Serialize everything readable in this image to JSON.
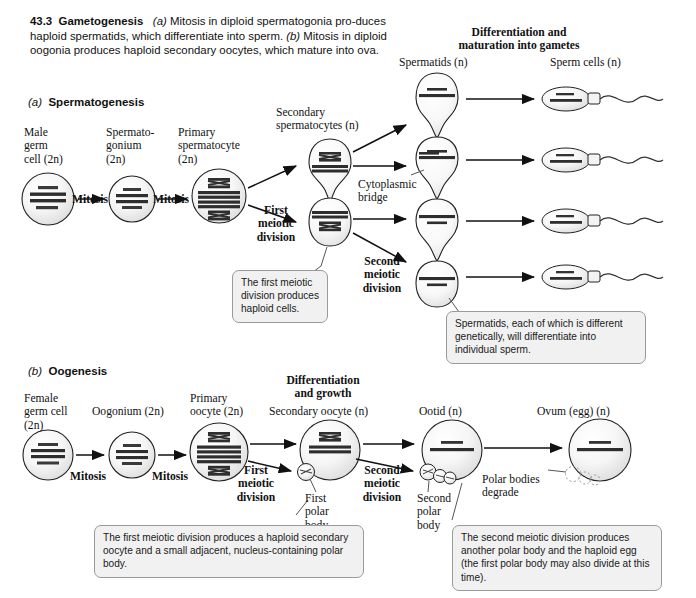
{
  "figure": {
    "number": "43.3",
    "title": "Gametogenesis",
    "caption_a_marker": "(a)",
    "caption_a": " Mitosis in diploid spermatogonia pro-duces haploid spermatids, which differentiate into sperm. ",
    "caption_b_marker": "(b)",
    "caption_b": " Mitosis in diploid oogonia produces haploid secondary oocytes, which mature into ova."
  },
  "section_a": {
    "marker": "(a)",
    "title": "Spermatogenesis",
    "labels": {
      "male_germ_cell": "Male\ngerm\ncell (2n)",
      "spermatogonium": "Spermato-\ngonium\n(2n)",
      "primary_spermatocyte": "Primary\nspermatocyte\n(2n)",
      "secondary_spermatocytes": "Secondary\nspermatocytes (n)",
      "spermatids": "Spermatids (n)",
      "sperm_cells": "Sperm cells (n)",
      "differentiation": "Differentiation and\nmaturation into gametes",
      "cytoplasmic_bridge": "Cytoplasmic\nbridge",
      "mitosis_1": "Mitosis",
      "mitosis_2": "Mitosis",
      "first_meiotic_division": "First\nmeiotic\ndivision",
      "second_meiotic_division": "Second\nmeiotic\ndivision"
    },
    "callouts": {
      "first_meiotic": "The first meiotic division produces haploid cells.",
      "spermatids": "Spermatids, each of which is different genetically, will differentiate into individual sperm."
    }
  },
  "section_b": {
    "marker": "(b)",
    "title": "Oogenesis",
    "labels": {
      "female_germ_cell": "Female\ngerm cell\n(2n)",
      "oogonium": "Oogonium (2n)",
      "primary_oocyte": "Primary\noocyte (2n)",
      "secondary_oocyte": "Secondary oocyte (n)",
      "ootid": "Ootid (n)",
      "ovum": "Ovum (egg) (n)",
      "differentiation_growth": "Differentiation\nand growth",
      "mitosis_1": "Mitosis",
      "mitosis_2": "Mitosis",
      "first_meiotic_division": "First\nmeiotic\ndivision",
      "second_meiotic_division": "Second\nmeiotic\ndivision",
      "first_polar_body": "First\npolar\nbody",
      "second_polar_body": "Second\npolar\nbody",
      "polar_bodies_degrade": "Polar bodies\ndegrade"
    },
    "callouts": {
      "first_meiotic": "The first meiotic division produces a haploid secondary oocyte and a small adjacent, nucleus-containing polar body.",
      "second_meiotic": "The second meiotic division produces another polar body and the haploid egg (the first polar body may also divide at this time)."
    }
  },
  "colors": {
    "ink": "#111111",
    "cell_fill_light": "#fafafa",
    "cell_fill_mid": "#e6e6e6",
    "chromosome": "#303030",
    "callout_bg": "#f1f1f1",
    "callout_border": "#9a9a9a"
  }
}
